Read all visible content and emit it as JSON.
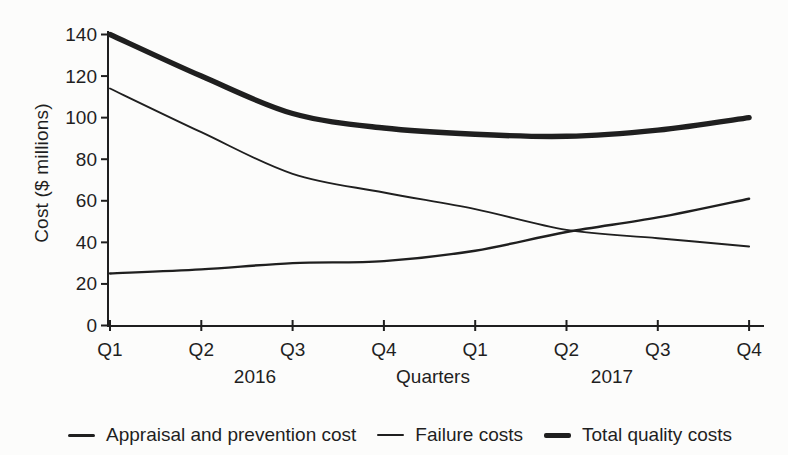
{
  "chart_data": {
    "type": "line",
    "categories": [
      "Q1",
      "Q2",
      "Q3",
      "Q4",
      "Q1",
      "Q2",
      "Q3",
      "Q4"
    ],
    "year_groups": [
      {
        "label": "2016",
        "quarter_indices": [
          0,
          3
        ]
      },
      {
        "label": "2017",
        "quarter_indices": [
          4,
          7
        ]
      }
    ],
    "series": [
      {
        "name": "Appraisal and prevention cost",
        "values": [
          25,
          27,
          30,
          31,
          36,
          45,
          52,
          61
        ]
      },
      {
        "name": "Failure costs",
        "values": [
          114,
          93,
          73,
          64,
          56,
          46,
          42,
          38
        ]
      },
      {
        "name": "Total quality costs",
        "values": [
          140,
          120,
          102,
          95,
          92,
          91,
          94,
          100
        ]
      }
    ],
    "title": "",
    "xlabel": "Quarters",
    "ylabel": "Cost ($ millions)",
    "ylim": [
      0,
      140
    ],
    "ytick_step": 20,
    "yticks": [
      0,
      20,
      40,
      60,
      80,
      100,
      120,
      140
    ],
    "grid": false,
    "legend_position": "bottom",
    "line_color": "#1f1f1f",
    "background_color": "#fcfcfb"
  }
}
